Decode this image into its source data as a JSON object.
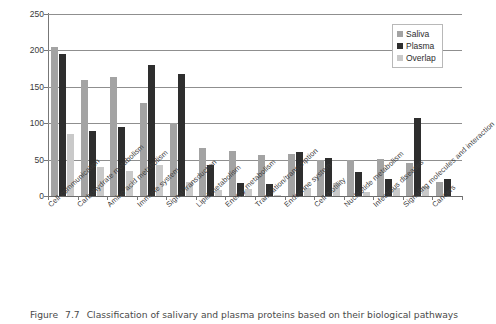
{
  "figure": {
    "caption_label": "Figure",
    "caption_number": "7.7",
    "caption_text": "Classification of salivary and plasma proteins based on their biological pathways"
  },
  "legend": {
    "position": "top-right",
    "entries": [
      {
        "label": "Saliva",
        "color": "#a3a3a3"
      },
      {
        "label": "Plasma",
        "color": "#2e2e2e"
      },
      {
        "label": "Overlap",
        "color": "#c9c9c9"
      }
    ]
  },
  "axes": {
    "y_ticks": [
      "0",
      "50",
      "100",
      "150",
      "200",
      "250"
    ],
    "y_min": 0,
    "y_max": 250,
    "y_step": 50
  },
  "chart_data": {
    "type": "bar",
    "title": "",
    "subtitle": "",
    "xlabel": "",
    "ylabel": "",
    "ylim": [
      0,
      250
    ],
    "ytick_step": 50,
    "grid": true,
    "legend_position": "top-right",
    "categories": [
      "Cell communication",
      "Carbohydrate metabolism",
      "Amino acid metabolism",
      "Immune system",
      "Signal transduction",
      "Lipid metabolism",
      "Energy metabolism",
      "Translation/transcription",
      "Endocrine system",
      "Cell motility",
      "Nucleotide metabolism",
      "Infectious diseases",
      "Signaling molecules and interaction",
      "Cancers"
    ],
    "series": [
      {
        "name": "Saliva",
        "color": "#a3a3a3",
        "values": [
          205,
          160,
          163,
          128,
          100,
          66,
          62,
          56,
          58,
          49,
          50,
          51,
          46,
          19
        ]
      },
      {
        "name": "Plasma",
        "color": "#2e2e2e",
        "values": [
          195,
          89,
          95,
          180,
          167,
          42,
          18,
          16,
          61,
          52,
          33,
          24,
          107,
          23
        ]
      },
      {
        "name": "Overlap",
        "color": "#c9c9c9",
        "values": [
          85,
          40,
          34,
          43,
          19,
          8,
          10,
          1,
          11,
          18,
          6,
          11,
          14,
          0
        ]
      }
    ]
  }
}
